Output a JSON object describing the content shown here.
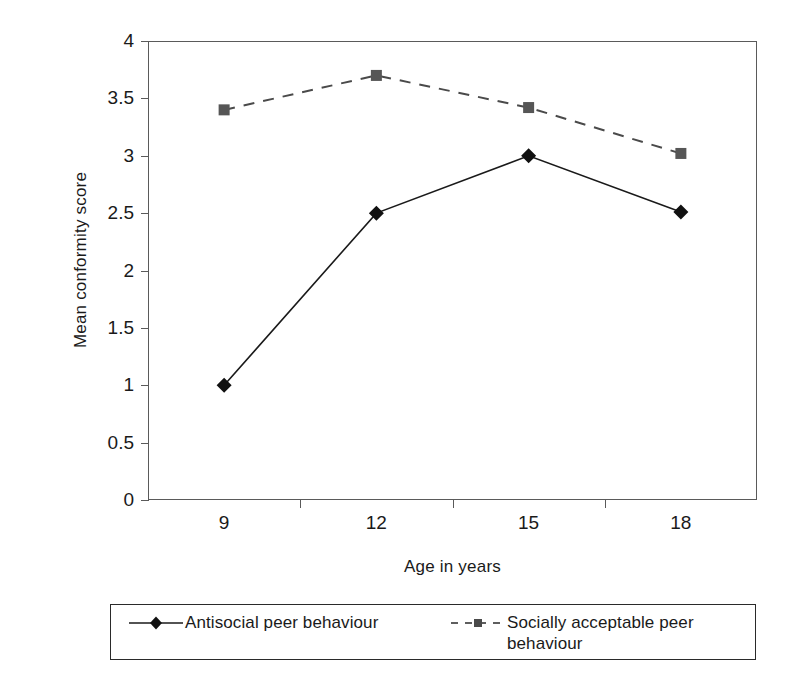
{
  "chart_data": {
    "type": "line",
    "title": "",
    "xlabel": "Age in years",
    "ylabel": "Mean conformity score",
    "categories": [
      "9",
      "12",
      "15",
      "18"
    ],
    "x": [
      9,
      12,
      15,
      18
    ],
    "ylim": [
      0,
      4
    ],
    "yticks": [
      "0",
      "0.5",
      "1",
      "1.5",
      "2",
      "2.5",
      "3",
      "3.5",
      "4"
    ],
    "ytick_values": [
      0,
      0.5,
      1,
      1.5,
      2,
      2.5,
      3,
      3.5,
      4
    ],
    "grid": false,
    "legend_position": "bottom",
    "series": [
      {
        "name": "Antisocial peer behaviour",
        "values": [
          1.0,
          2.5,
          3.0,
          2.51
        ],
        "marker": "diamond",
        "line_style": "solid",
        "color": "#1a1a1a"
      },
      {
        "name": "Socially acceptable peer behaviour",
        "values": [
          3.4,
          3.7,
          3.42,
          3.02
        ],
        "marker": "square",
        "line_style": "dashed",
        "color": "#4a4a4a"
      }
    ]
  },
  "legend": {
    "entries": [
      {
        "label": "Antisocial peer behaviour"
      },
      {
        "label": "Socially acceptable peer behaviour"
      }
    ]
  },
  "colors": {
    "axis": "#5a5a5a",
    "text": "#1a1a1a",
    "series_1": "#1a1a1a",
    "series_2": "#4a4a4a",
    "background": "#ffffff"
  }
}
